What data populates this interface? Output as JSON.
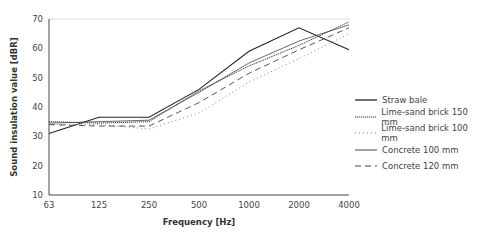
{
  "chart_data": {
    "type": "line",
    "title": "",
    "xlabel": "Frequency [Hz]",
    "ylabel": "Sound insulation value [dBR]",
    "x": [
      "63",
      "125",
      "250",
      "500",
      "1000",
      "2000",
      "4000"
    ],
    "ylim": [
      10,
      70
    ],
    "yticks": [
      10,
      20,
      30,
      40,
      50,
      60,
      70
    ],
    "grid": false,
    "legend_position": "right",
    "series": [
      {
        "name": "Straw bale",
        "style": "solid",
        "values": [
          31,
          36.5,
          36.5,
          46,
          59,
          67,
          59.5
        ]
      },
      {
        "name": "Lime-sand brick 150 mm",
        "style": "densely-dotted",
        "values": [
          35,
          34.5,
          35,
          45.5,
          54,
          61,
          69
        ]
      },
      {
        "name": "Lime-sand brick 100 mm",
        "style": "dotted",
        "values": [
          34,
          34,
          32.5,
          38,
          48.5,
          56.5,
          65
        ]
      },
      {
        "name": "Concrete 100 mm",
        "style": "solid-thin",
        "values": [
          34.5,
          35,
          35.5,
          45,
          55,
          62.5,
          68
        ]
      },
      {
        "name": "Concrete 120 mm",
        "style": "dashed",
        "values": [
          34,
          33.5,
          33.5,
          41.5,
          51.5,
          59.5,
          67
        ]
      }
    ]
  }
}
